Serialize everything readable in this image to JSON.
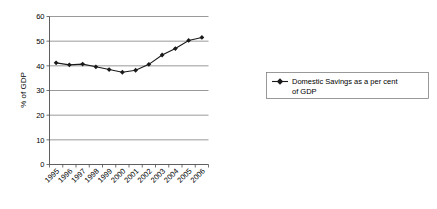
{
  "chart_data": {
    "type": "line",
    "title": "",
    "xlabel": "",
    "ylabel": "% of GDP",
    "ylim": [
      0,
      60
    ],
    "ytick_step": 10,
    "yticks": [
      "0",
      "10",
      "20",
      "30",
      "40",
      "50",
      "60"
    ],
    "grid": true,
    "legend_position": "right",
    "marker": "diamond",
    "line_color": "#1a1a1a",
    "grid_color": "#808080",
    "categories": [
      "1995",
      "1996",
      "1997",
      "1998",
      "1999",
      "2000",
      "2001",
      "2002",
      "2003",
      "2004",
      "2005",
      "2006"
    ],
    "series": [
      {
        "name": "Domestic Savings as a per cent of GDP",
        "values": [
          41.2,
          40.4,
          40.7,
          39.6,
          38.5,
          37.4,
          38.2,
          40.6,
          44.4,
          47.0,
          50.3,
          51.5
        ]
      }
    ]
  },
  "legend": {
    "entries": [
      {
        "label": "Domestic Savings as a per cent of GDP"
      }
    ]
  }
}
